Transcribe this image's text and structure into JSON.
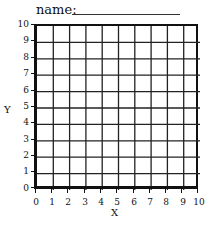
{
  "header": {
    "name_label": "name:",
    "name_value": ""
  },
  "graph": {
    "x_axis_label": "X",
    "y_axis_label": "Y",
    "x_ticks": [
      "0",
      "1",
      "2",
      "3",
      "4",
      "5",
      "6",
      "7",
      "8",
      "9",
      "10"
    ],
    "y_ticks": [
      "10",
      "9",
      "8",
      "7",
      "6",
      "5",
      "4",
      "3",
      "2",
      "1",
      "0"
    ],
    "x_range": [
      0,
      10
    ],
    "y_range": [
      0,
      10
    ],
    "grid_divisions": 10,
    "line_color": "#111111",
    "background": "#ffffff"
  }
}
